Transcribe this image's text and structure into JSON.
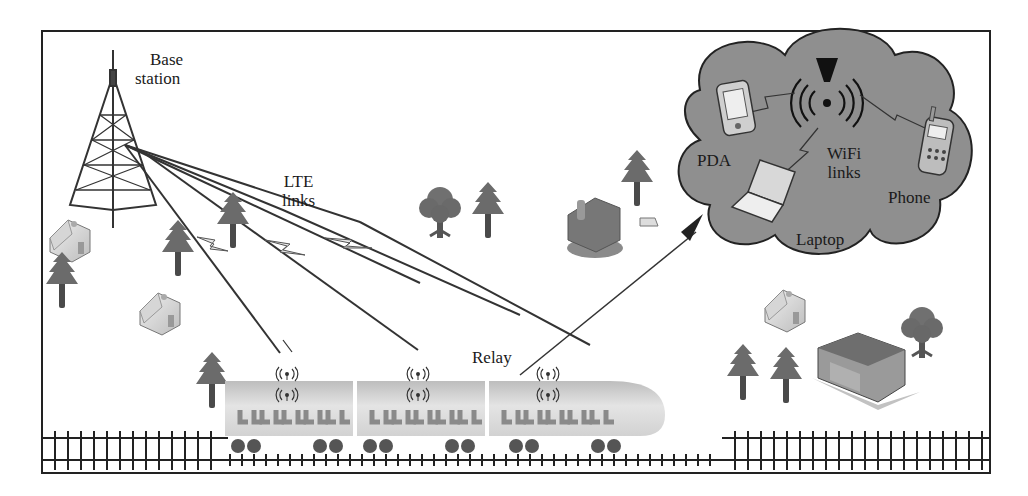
{
  "diagram": {
    "type": "network-scenario",
    "frame": {
      "x": 42,
      "y": 31,
      "width": 948,
      "height": 442,
      "border_color": "#222222"
    }
  },
  "labels": {
    "base_station": [
      "Base",
      "station"
    ],
    "lte_links": [
      "LTE",
      "links"
    ],
    "relay": "Relay",
    "pda": "PDA",
    "wifi_links": [
      "WiFi",
      "links"
    ],
    "phone": "Phone",
    "laptop": "Laptop"
  },
  "nodes": [
    {
      "id": "base-station",
      "label": "Base station",
      "kind": "tower"
    },
    {
      "id": "relay-1",
      "label": "Relay",
      "kind": "antenna",
      "car": 1
    },
    {
      "id": "relay-2",
      "label": "Relay",
      "kind": "antenna",
      "car": 2
    },
    {
      "id": "relay-3",
      "label": "Relay",
      "kind": "antenna",
      "car": 3
    },
    {
      "id": "wifi-ap",
      "label": "WiFi",
      "kind": "access-point"
    },
    {
      "id": "pda",
      "label": "PDA",
      "kind": "device"
    },
    {
      "id": "phone",
      "label": "Phone",
      "kind": "device"
    },
    {
      "id": "laptop",
      "label": "Laptop",
      "kind": "device"
    }
  ],
  "edges": [
    {
      "from": "base-station",
      "to": "relay-1",
      "label": "LTE links"
    },
    {
      "from": "base-station",
      "to": "relay-2",
      "label": "LTE links"
    },
    {
      "from": "base-station",
      "to": "relay-3",
      "label": "LTE links"
    },
    {
      "from": "relay-2",
      "to": "wifi-ap",
      "kind": "zoom-arrow"
    },
    {
      "from": "wifi-ap",
      "to": "pda",
      "label": "WiFi links"
    },
    {
      "from": "wifi-ap",
      "to": "phone",
      "label": "WiFi links"
    },
    {
      "from": "wifi-ap",
      "to": "laptop",
      "label": "WiFi links"
    }
  ],
  "colors": {
    "cloud_fill": "#8c8c8c",
    "tree": "#6a6a6a",
    "train_top": "#c8c8c8",
    "train_bottom": "#e6e6e6",
    "wheel": "#555555",
    "line": "#333333"
  }
}
